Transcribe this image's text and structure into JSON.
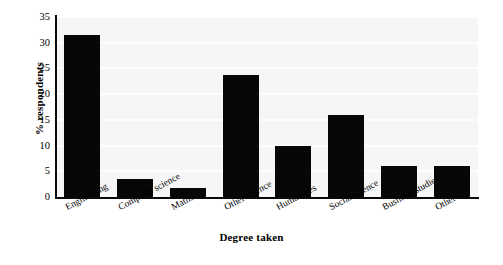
{
  "chart_data": {
    "type": "bar",
    "title": "",
    "xlabel": "Degree taken",
    "ylabel": "% respondents",
    "categories": [
      "Engineering",
      "Computer science",
      "Maths",
      "Other science",
      "Humanities",
      "Social science",
      "Business studies",
      "Other"
    ],
    "values": [
      31.6,
      3.6,
      1.8,
      23.8,
      10.0,
      16.0,
      6.0,
      6.0
    ],
    "ylim": [
      0,
      35
    ],
    "ytick_labels": [
      "35",
      "30",
      "25",
      "20",
      "15",
      "10",
      "5",
      "0"
    ],
    "ytick_values": [
      35,
      30,
      25,
      20,
      15,
      10,
      5,
      0
    ],
    "grid": true,
    "legend": false,
    "bar_color": "#070707",
    "plot_background": "#f6f6f6",
    "gridline_color": "#fdfdfd",
    "axis_color": "#0a0a0a"
  }
}
